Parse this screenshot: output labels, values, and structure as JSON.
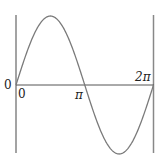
{
  "diagram": {
    "type": "sine-wave-plot",
    "function": "sin(x)",
    "x_range": [
      "0",
      "2π"
    ],
    "labels": {
      "y_origin": "0",
      "x_zero": "0",
      "x_pi": "π",
      "x_two_pi": "2π"
    },
    "colors": {
      "curve": "#7a7a7a",
      "axis": "#555555",
      "boundary_lines": "#888888",
      "text": "#222222"
    }
  }
}
